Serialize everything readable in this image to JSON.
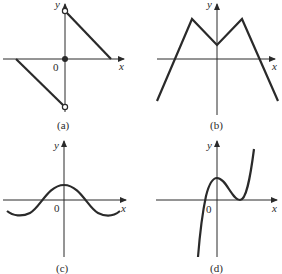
{
  "panels": [
    {
      "id": "a",
      "caption": "(a)",
      "x_label": "x",
      "y_label": "y",
      "origin_label": "0",
      "description": "Piecewise linear: segment from open circle on positive y-axis down to x-axis at right; segment from x-axis at left down to open circle on negative y-axis; filled dot at origin"
    },
    {
      "id": "b",
      "caption": "(b)",
      "x_label": "x",
      "y_label": "y",
      "origin_label": "",
      "description": "Symmetric piecewise linear M-shape: two peaks, central dip on y-axis above x-axis, both ends descending below x-axis"
    },
    {
      "id": "c",
      "caption": "(c)",
      "x_label": "x",
      "y_label": "y",
      "origin_label": "0",
      "description": "Cosine-like wave with maximum on y-axis and minima near ends"
    },
    {
      "id": "d",
      "caption": "(d)",
      "x_label": "x",
      "y_label": "y",
      "origin_label": "0",
      "description": "Cubic-like curve: rises from bottom left, crosses x-axis left of origin, local max on y-axis, touches x-axis at local min to the right, rises steeply"
    }
  ],
  "colors": {
    "ink": "#2a2a2a",
    "background": "#ffffff"
  }
}
